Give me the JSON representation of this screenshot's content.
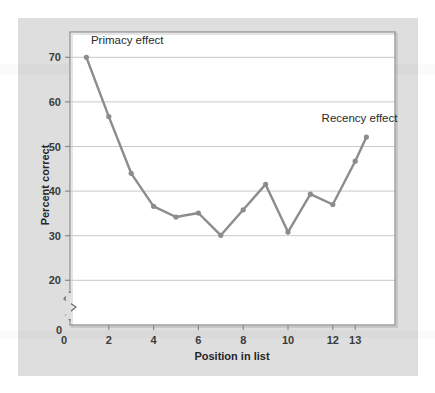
{
  "figure": {
    "background_color": "#ffffff",
    "panel_color": "#dedede",
    "plot_background": "#ffffff",
    "frame_color": "#8a8a8a",
    "gridline_color": "#c9c9c9"
  },
  "chart_data": {
    "type": "line",
    "title": "",
    "xlabel": "Position in list",
    "ylabel": "Percent correct",
    "x": [
      1,
      2,
      3,
      4,
      5,
      6,
      7,
      8,
      9,
      10,
      11,
      12,
      13
    ],
    "values": [
      70.0,
      56.7,
      44.0,
      36.6,
      34.2,
      35.1,
      30.1,
      35.8,
      41.5,
      30.8,
      39.3,
      37.0,
      46.7
    ],
    "series": [
      {
        "name": "Percent correct",
        "color": "#8c8c8c",
        "values": [
          70.0,
          56.7,
          44.0,
          36.6,
          34.2,
          35.1,
          30.1,
          35.8,
          41.5,
          30.8,
          39.3,
          37.0,
          46.7
        ]
      }
    ],
    "extra_point": {
      "x": 13.5,
      "y": 52.1,
      "note": "final rising endpoint beyond the 13 tick"
    },
    "xlim": [
      0,
      14
    ],
    "ylim": [
      20,
      74
    ],
    "y_axis_break": true,
    "y_axis_break_symbol": "zigzag",
    "xticks": [
      0,
      2,
      4,
      6,
      8,
      10,
      12,
      13
    ],
    "xtick_labels": [
      "0",
      "2",
      "4",
      "6",
      "8",
      "10",
      "12",
      "13"
    ],
    "yticks": [
      20,
      30,
      40,
      50,
      60,
      70
    ],
    "ytick_labels": [
      "20",
      "30",
      "40",
      "50",
      "60",
      "70"
    ],
    "y_origin_label": "0",
    "grid": "horizontal",
    "legend": "none",
    "marker": "circle",
    "annotations": [
      {
        "text": "Primacy effect",
        "x": 1.2,
        "y": 73.0,
        "anchor": "start"
      },
      {
        "text": "Recency effect",
        "x": 11.5,
        "y": 55.5,
        "anchor": "start"
      }
    ]
  }
}
